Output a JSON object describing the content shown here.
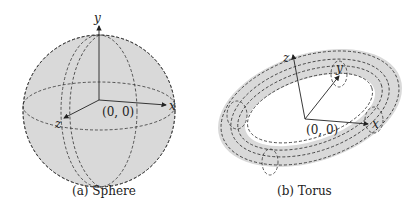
{
  "figure": {
    "sphere": {
      "caption": "(a) Sphere",
      "axes": {
        "x": "x",
        "y": "y",
        "z": "z"
      },
      "origin_label": "(0, 0)",
      "fill_color": "#d9d9d9"
    },
    "torus": {
      "caption": "(b) Torus",
      "axes": {
        "x": "x",
        "y": "y",
        "z": "z"
      },
      "origin_label": "(0, 0)",
      "fill_color": "#d9d9d9"
    }
  }
}
